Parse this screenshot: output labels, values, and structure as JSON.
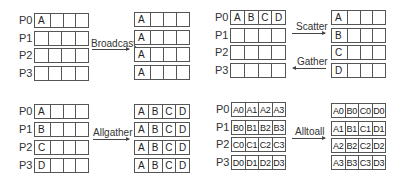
{
  "process_labels": [
    "P0",
    "P1",
    "P2",
    "P3"
  ],
  "broadcast": {
    "label": "Broadcast",
    "before": [
      [
        "A",
        "",
        "",
        ""
      ],
      [
        "",
        "",
        "",
        ""
      ],
      [
        "",
        "",
        "",
        ""
      ],
      [
        "",
        "",
        "",
        ""
      ]
    ],
    "after": [
      [
        "A",
        "",
        "",
        ""
      ],
      [
        "A",
        "",
        "",
        ""
      ],
      [
        "A",
        "",
        "",
        ""
      ],
      [
        "A",
        "",
        "",
        ""
      ]
    ]
  },
  "scatter_gather": {
    "scatter_label": "Scatter",
    "gather_label": "Gather",
    "before": [
      [
        "A",
        "B",
        "C",
        "D"
      ],
      [
        "",
        "",
        "",
        ""
      ],
      [
        "",
        "",
        "",
        ""
      ],
      [
        "",
        "",
        "",
        ""
      ]
    ],
    "after": [
      [
        "A",
        "",
        "",
        ""
      ],
      [
        "B",
        "",
        "",
        ""
      ],
      [
        "C",
        "",
        "",
        ""
      ],
      [
        "D",
        "",
        "",
        ""
      ]
    ]
  },
  "allgather": {
    "label": "Allgather",
    "before": [
      [
        "A",
        "",
        "",
        ""
      ],
      [
        "B",
        "",
        "",
        ""
      ],
      [
        "C",
        "",
        "",
        ""
      ],
      [
        "D",
        "",
        "",
        ""
      ]
    ],
    "after": [
      [
        "A",
        "B",
        "C",
        "D"
      ],
      [
        "A",
        "B",
        "C",
        "D"
      ],
      [
        "A",
        "B",
        "C",
        "D"
      ],
      [
        "A",
        "B",
        "C",
        "D"
      ]
    ]
  },
  "alltoall": {
    "label": "Alltoall",
    "before": [
      [
        "A0",
        "A1",
        "A2",
        "A3"
      ],
      [
        "B0",
        "B1",
        "B2",
        "B3"
      ],
      [
        "C0",
        "C1",
        "C2",
        "C3"
      ],
      [
        "D0",
        "D1",
        "D2",
        "D3"
      ]
    ],
    "after": [
      [
        "A0",
        "B0",
        "C0",
        "D0"
      ],
      [
        "A1",
        "B1",
        "C1",
        "D1"
      ],
      [
        "A2",
        "B2",
        "C2",
        "D2"
      ],
      [
        "A3",
        "B3",
        "C3",
        "D3"
      ]
    ]
  }
}
